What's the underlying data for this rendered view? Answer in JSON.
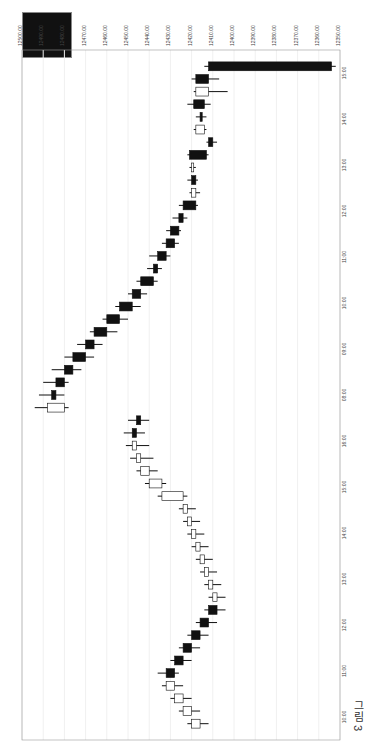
{
  "caption": "그림 3",
  "chart_data": {
    "type": "candlestick",
    "orientation": "rotated-90",
    "title": "",
    "price_axis": {
      "position": "top",
      "labels": [
        "12500.00",
        "12490.00",
        "12480.00",
        "12470.00",
        "12460.00",
        "12450.00",
        "12440.00",
        "12430.00",
        "12420.00",
        "12410.00",
        "12400.00",
        "12390.00",
        "12380.00",
        "12370.00",
        "12360.00",
        "12350.00"
      ],
      "range": [
        12350,
        12500
      ],
      "note": "range endpoints and ordering read from blurry rotated render; treat as approximate"
    },
    "time_axis": {
      "position": "right",
      "labels_top_to_bottom": [
        "15:00",
        "14:00",
        "13:00",
        "12:00",
        "11:00",
        "10:00",
        "09:00",
        "08:00",
        "16:00",
        "15:00",
        "14:00",
        "13:00",
        "12:00",
        "11:00",
        "10:00"
      ],
      "session_boundary_label": "08:00",
      "note": "a date label appears next to 08:00 but is not legible"
    },
    "info_box": {
      "rows": 7,
      "note": "dark box with ~7 label/value rows; text not legible at this resolution"
    },
    "candles_note": "OHLC values are eyeballed estimates of bar positions, not read from labels; shape only",
    "candles": [
      {
        "t": "15:00",
        "o": 12412,
        "h": 12414,
        "l": 12352,
        "c": 12354,
        "up": false
      },
      {
        "t": "14:45",
        "o": 12418,
        "h": 12420,
        "l": 12407,
        "c": 12412,
        "up": false
      },
      {
        "t": "14:30",
        "o": 12412,
        "h": 12419,
        "l": 12403,
        "c": 12418,
        "up": true
      },
      {
        "t": "14:15",
        "o": 12419,
        "h": 12422,
        "l": 12411,
        "c": 12414,
        "up": false
      },
      {
        "t": "14:00",
        "o": 12416,
        "h": 12418,
        "l": 12413,
        "c": 12415,
        "up": false
      },
      {
        "t": "13:45",
        "o": 12414,
        "h": 12419,
        "l": 12413,
        "c": 12418,
        "up": true
      },
      {
        "t": "13:30",
        "o": 12412,
        "h": 12413,
        "l": 12408,
        "c": 12410,
        "up": false
      },
      {
        "t": "13:15",
        "o": 12421,
        "h": 12422,
        "l": 12412,
        "c": 12413,
        "up": false
      },
      {
        "t": "13:00",
        "o": 12419,
        "h": 12421,
        "l": 12418,
        "c": 12420,
        "up": true
      },
      {
        "t": "12:45",
        "o": 12420,
        "h": 12422,
        "l": 12417,
        "c": 12418,
        "up": false
      },
      {
        "t": "12:30",
        "o": 12418,
        "h": 12421,
        "l": 12416,
        "c": 12420,
        "up": true
      },
      {
        "t": "12:15",
        "o": 12424,
        "h": 12426,
        "l": 12417,
        "c": 12418,
        "up": false
      },
      {
        "t": "12:00",
        "o": 12426,
        "h": 12429,
        "l": 12422,
        "c": 12424,
        "up": false
      },
      {
        "t": "11:45",
        "o": 12430,
        "h": 12432,
        "l": 12425,
        "c": 12426,
        "up": false
      },
      {
        "t": "11:30",
        "o": 12432,
        "h": 12434,
        "l": 12426,
        "c": 12428,
        "up": false
      },
      {
        "t": "11:15",
        "o": 12436,
        "h": 12440,
        "l": 12430,
        "c": 12432,
        "up": false
      },
      {
        "t": "11:00",
        "o": 12438,
        "h": 12441,
        "l": 12434,
        "c": 12436,
        "up": false
      },
      {
        "t": "10:45",
        "o": 12444,
        "h": 12446,
        "l": 12436,
        "c": 12438,
        "up": false
      },
      {
        "t": "10:30",
        "o": 12448,
        "h": 12450,
        "l": 12441,
        "c": 12444,
        "up": false
      },
      {
        "t": "10:15",
        "o": 12454,
        "h": 12456,
        "l": 12444,
        "c": 12448,
        "up": false
      },
      {
        "t": "10:00",
        "o": 12460,
        "h": 12462,
        "l": 12450,
        "c": 12454,
        "up": false
      },
      {
        "t": "09:45",
        "o": 12466,
        "h": 12468,
        "l": 12455,
        "c": 12460,
        "up": false
      },
      {
        "t": "09:30",
        "o": 12470,
        "h": 12474,
        "l": 12462,
        "c": 12466,
        "up": false
      },
      {
        "t": "09:15",
        "o": 12476,
        "h": 12480,
        "l": 12466,
        "c": 12470,
        "up": false
      },
      {
        "t": "09:00",
        "o": 12480,
        "h": 12486,
        "l": 12472,
        "c": 12476,
        "up": false
      },
      {
        "t": "08:45",
        "o": 12484,
        "h": 12490,
        "l": 12478,
        "c": 12480,
        "up": false
      },
      {
        "t": "08:30",
        "o": 12486,
        "h": 12492,
        "l": 12480,
        "c": 12484,
        "up": false
      },
      {
        "t": "08:15",
        "o": 12480,
        "h": 12494,
        "l": 12478,
        "c": 12488,
        "up": true
      },
      {
        "t": "16:00",
        "o": 12446,
        "h": 12450,
        "l": 12440,
        "c": 12444,
        "up": false
      },
      {
        "t": "15:45",
        "o": 12448,
        "h": 12452,
        "l": 12442,
        "c": 12446,
        "up": false
      },
      {
        "t": "15:30",
        "o": 12446,
        "h": 12451,
        "l": 12440,
        "c": 12448,
        "up": true
      },
      {
        "t": "15:15",
        "o": 12444,
        "h": 12449,
        "l": 12438,
        "c": 12446,
        "up": true
      },
      {
        "t": "15:00",
        "o": 12440,
        "h": 12446,
        "l": 12436,
        "c": 12444,
        "up": true
      },
      {
        "t": "14:45",
        "o": 12434,
        "h": 12442,
        "l": 12432,
        "c": 12440,
        "up": true
      },
      {
        "t": "14:30",
        "o": 12424,
        "h": 12436,
        "l": 12422,
        "c": 12434,
        "up": true
      },
      {
        "t": "14:15",
        "o": 12422,
        "h": 12426,
        "l": 12418,
        "c": 12424,
        "up": true
      },
      {
        "t": "14:00",
        "o": 12420,
        "h": 12424,
        "l": 12416,
        "c": 12422,
        "up": true
      },
      {
        "t": "13:45",
        "o": 12418,
        "h": 12422,
        "l": 12414,
        "c": 12420,
        "up": true
      },
      {
        "t": "13:30",
        "o": 12416,
        "h": 12420,
        "l": 12412,
        "c": 12418,
        "up": true
      },
      {
        "t": "13:15",
        "o": 12414,
        "h": 12418,
        "l": 12410,
        "c": 12416,
        "up": true
      },
      {
        "t": "13:00",
        "o": 12412,
        "h": 12416,
        "l": 12408,
        "c": 12414,
        "up": true
      },
      {
        "t": "12:45",
        "o": 12410,
        "h": 12414,
        "l": 12406,
        "c": 12412,
        "up": true
      },
      {
        "t": "12:30",
        "o": 12408,
        "h": 12412,
        "l": 12404,
        "c": 12410,
        "up": true
      },
      {
        "t": "12:15",
        "o": 12412,
        "h": 12414,
        "l": 12404,
        "c": 12408,
        "up": false
      },
      {
        "t": "12:00",
        "o": 12416,
        "h": 12418,
        "l": 12408,
        "c": 12412,
        "up": false
      },
      {
        "t": "11:45",
        "o": 12420,
        "h": 12422,
        "l": 12412,
        "c": 12416,
        "up": false
      },
      {
        "t": "11:30",
        "o": 12424,
        "h": 12426,
        "l": 12416,
        "c": 12420,
        "up": false
      },
      {
        "t": "11:15",
        "o": 12428,
        "h": 12430,
        "l": 12420,
        "c": 12424,
        "up": false
      },
      {
        "t": "11:00",
        "o": 12432,
        "h": 12436,
        "l": 12426,
        "c": 12428,
        "up": false
      },
      {
        "t": "10:45",
        "o": 12428,
        "h": 12434,
        "l": 12424,
        "c": 12432,
        "up": true
      },
      {
        "t": "10:30",
        "o": 12424,
        "h": 12430,
        "l": 12420,
        "c": 12428,
        "up": true
      },
      {
        "t": "10:15",
        "o": 12420,
        "h": 12426,
        "l": 12416,
        "c": 12424,
        "up": true
      },
      {
        "t": "10:00",
        "o": 12416,
        "h": 12422,
        "l": 12412,
        "c": 12420,
        "up": true
      }
    ]
  }
}
